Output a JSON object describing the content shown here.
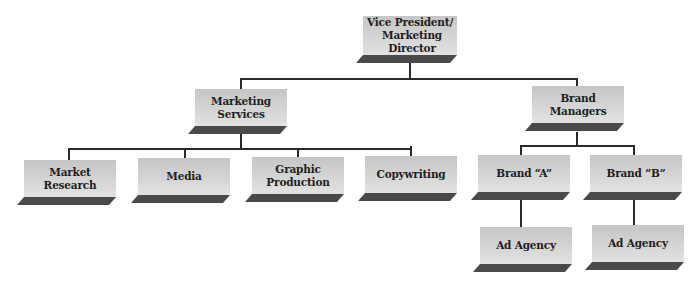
{
  "diagram": {
    "type": "organization-chart",
    "colors": {
      "box_face": "#d2d2d2",
      "box_shelf": "#4a4a4a",
      "connector": "#2a2a2a",
      "text": "#1e1e1e"
    },
    "nodes": {
      "vp": {
        "label_line1": "Vice President/",
        "label_line2": "Marketing Director"
      },
      "marketing_services": {
        "label": "Marketing Services"
      },
      "brand_managers": {
        "label": "Brand Managers"
      },
      "market_research": {
        "label": "Market Research"
      },
      "media": {
        "label": "Media"
      },
      "graphic_production": {
        "label": "Graphic Production"
      },
      "copywriting": {
        "label": "Copywriting"
      },
      "brand_a": {
        "label": "Brand “A”"
      },
      "brand_b": {
        "label": "Brand “B”"
      },
      "ad_agency_a": {
        "label": "Ad Agency"
      },
      "ad_agency_b": {
        "label": "Ad Agency"
      }
    },
    "hierarchy": [
      {
        "parent": "Vice President/Marketing Director",
        "children": [
          "Marketing Services",
          "Brand Managers"
        ]
      },
      {
        "parent": "Marketing Services",
        "children": [
          "Market Research",
          "Media",
          "Graphic Production",
          "Copywriting"
        ]
      },
      {
        "parent": "Brand Managers",
        "children": [
          "Brand “A”",
          "Brand “B”"
        ]
      },
      {
        "parent": "Brand “A”",
        "children": [
          "Ad Agency"
        ]
      },
      {
        "parent": "Brand “B”",
        "children": [
          "Ad Agency"
        ]
      }
    ]
  }
}
